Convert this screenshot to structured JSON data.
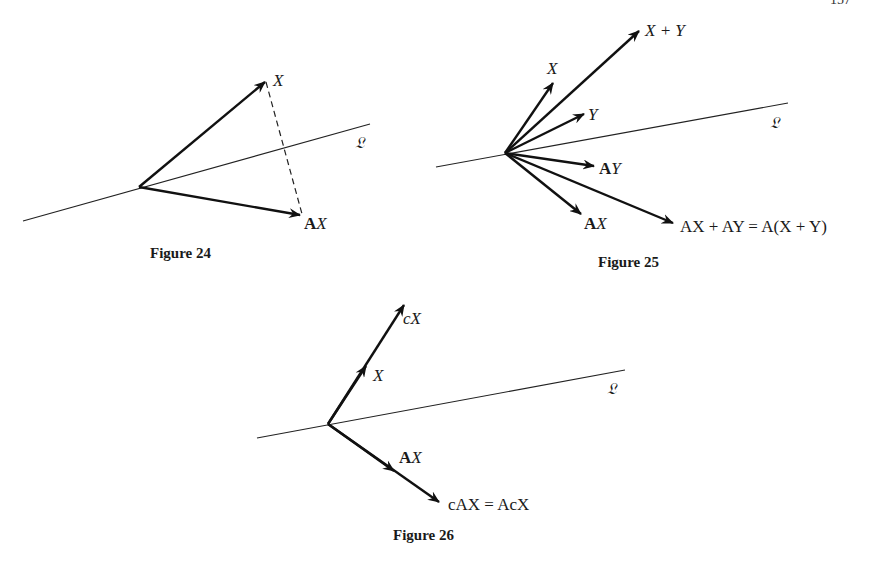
{
  "page": {
    "number_fragment": "157"
  },
  "line_label": "𝔏",
  "figures": [
    {
      "caption": "Figure 24",
      "labels": {
        "x": "X",
        "ax_bold": "A",
        "ax_it": "X"
      }
    },
    {
      "caption": "Figure 25",
      "labels": {
        "x": "X",
        "xy": "X + Y",
        "y": "Y",
        "ay_bold": "A",
        "ay_it": "Y",
        "ax_bold": "A",
        "ax_it": "X",
        "sum": "AX + AY = A(X + Y)"
      }
    },
    {
      "caption": "Figure 26",
      "labels": {
        "cx": "cX",
        "x": "X",
        "ax_bold": "A",
        "ax_it": "X",
        "cax": "cAX = AcX"
      }
    }
  ],
  "colors": {
    "ink": "#111111",
    "paper": "#ffffff"
  }
}
